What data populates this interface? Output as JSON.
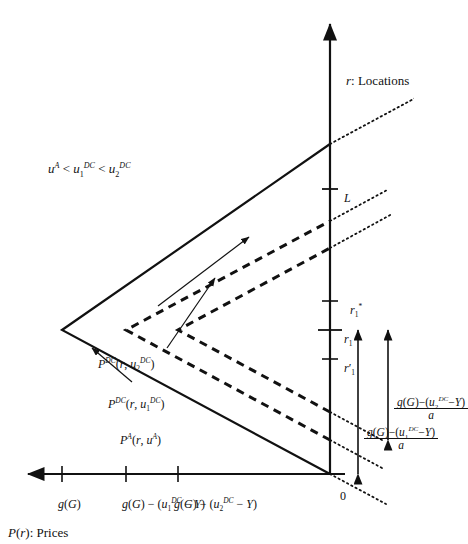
{
  "figure": {
    "type": "diagram",
    "orientation": "rotated-90-ccw",
    "axes": {
      "y_axis_label": "P(r): Prices",
      "x_axis_label": "r: Locations",
      "origin_label": "0",
      "x_ticks": [
        {
          "id": "r1prime",
          "label": "r′1"
        },
        {
          "id": "r1",
          "label": "r1"
        },
        {
          "id": "r1star",
          "label": "r*1"
        },
        {
          "id": "L",
          "label": "L"
        }
      ],
      "y_ticks": [
        {
          "id": "gG",
          "label": "g(G)"
        },
        {
          "id": "gG-u1",
          "label": "g(G) − (uDC1 − Y)"
        },
        {
          "id": "gG-u2",
          "label": "g(G) − (uDC2 − Y)"
        }
      ]
    },
    "curves": [
      {
        "id": "PA",
        "label": "PA(r, uA)",
        "style": "solid",
        "peak_level": "g(G)"
      },
      {
        "id": "PDC1",
        "label": "PDC(r, uDC1)",
        "style": "dashed",
        "peak_level": "g(G) − (uDC1 − Y)"
      },
      {
        "id": "PDC2",
        "label": "PDC(r, uDC2)",
        "style": "dashed",
        "peak_level": "g(G) − (uDC2 − Y)"
      }
    ],
    "annotations": {
      "inequality": "uA < uDC1 < uDC2",
      "span1_numerator": "g(G)−(uDC1−Y)",
      "span1_denominator": "a",
      "span2_numerator": "g(G)−(uDC2−Y)",
      "span2_denominator": "a"
    },
    "colors": {
      "ink": "#111111",
      "background": "#ffffff"
    }
  }
}
